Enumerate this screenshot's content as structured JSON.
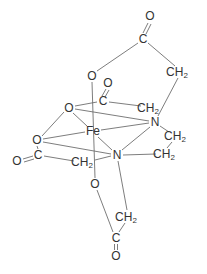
{
  "diagram": {
    "colors": {
      "bond": "#6e6e6e",
      "text": "#333333",
      "background": "#ffffff"
    },
    "atoms": [
      {
        "id": "o_top_carbonyl",
        "label": "O",
        "x": 150,
        "y": 16
      },
      {
        "id": "c_top",
        "label": "C",
        "x": 143,
        "y": 39
      },
      {
        "id": "ch2_top_right",
        "label": "CH",
        "sub": "2",
        "x": 180,
        "y": 72
      },
      {
        "id": "o_upper",
        "label": "O",
        "x": 92,
        "y": 76
      },
      {
        "id": "o_mid_carbonyl",
        "label": "O",
        "x": 108,
        "y": 83
      },
      {
        "id": "c_mid",
        "label": "C",
        "x": 103,
        "y": 101
      },
      {
        "id": "ch2_mid",
        "label": "CH",
        "sub": "2",
        "x": 150,
        "y": 108
      },
      {
        "id": "o_left_upper",
        "label": "O",
        "x": 69,
        "y": 108
      },
      {
        "id": "n_upper",
        "label": "N",
        "x": 155,
        "y": 122
      },
      {
        "id": "fe",
        "label": "Fe",
        "x": 93,
        "y": 131
      },
      {
        "id": "ch2_right",
        "label": "CH",
        "sub": "2",
        "x": 177,
        "y": 136
      },
      {
        "id": "o_left",
        "label": "O",
        "x": 37,
        "y": 140
      },
      {
        "id": "ch2_lower_right",
        "label": "CH",
        "sub": "2",
        "x": 166,
        "y": 154
      },
      {
        "id": "c_left",
        "label": "C",
        "x": 38,
        "y": 155
      },
      {
        "id": "n_lower",
        "label": "N",
        "x": 117,
        "y": 155
      },
      {
        "id": "o_far_left_carbonyl",
        "label": "O",
        "x": 17,
        "y": 161
      },
      {
        "id": "ch2_lower_left",
        "label": "CH",
        "sub": "2",
        "x": 84,
        "y": 162
      },
      {
        "id": "o_lower",
        "label": "O",
        "x": 95,
        "y": 184
      },
      {
        "id": "ch2_bottom",
        "label": "CH",
        "sub": "2",
        "x": 128,
        "y": 217
      },
      {
        "id": "c_bottom",
        "label": "C",
        "x": 116,
        "y": 238
      },
      {
        "id": "o_bottom_carbonyl",
        "label": "O",
        "x": 116,
        "y": 256
      }
    ]
  }
}
